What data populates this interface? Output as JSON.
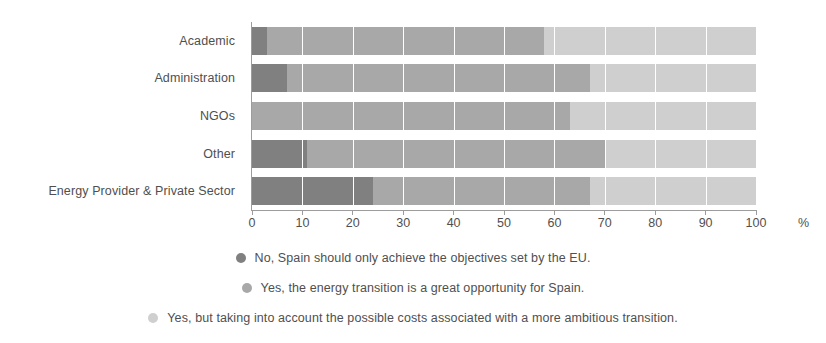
{
  "chart_data": {
    "type": "bar",
    "orientation": "horizontal",
    "stacked": true,
    "stack_mode": "percent",
    "title": "",
    "subtitle": "",
    "xlabel": "%",
    "ylabel": "",
    "xlim": [
      0,
      100
    ],
    "xticks": [
      0,
      10,
      20,
      30,
      40,
      50,
      60,
      70,
      80,
      90,
      100
    ],
    "xtick_labels": [
      "0",
      "10",
      "20",
      "30",
      "40",
      "50",
      "60",
      "70",
      "80",
      "90",
      "100"
    ],
    "grid": true,
    "grid_axis": "x",
    "legend_position": "bottom",
    "categories": [
      "Academic",
      "Administration",
      "NGOs",
      "Other",
      "Energy Provider & Private Sector"
    ],
    "series": [
      {
        "name": "No, Spain should only achieve the objectives set by the EU.",
        "color": "#808080",
        "values": [
          3,
          7,
          0,
          11,
          24
        ]
      },
      {
        "name": "Yes, the energy transition is a great opportunity for Spain.",
        "color": "#a8a8a8",
        "values": [
          55,
          60,
          63,
          59,
          43
        ]
      },
      {
        "name": "Yes, but taking into account the possible costs associated with a more ambitious transition.",
        "color": "#cfcfcf",
        "values": [
          42,
          33,
          37,
          30,
          33
        ]
      }
    ],
    "cumulative_boundaries": [
      [
        3,
        58
      ],
      [
        7,
        67
      ],
      [
        0,
        63
      ],
      [
        11,
        70
      ],
      [
        24,
        67
      ]
    ]
  },
  "axis": {
    "unit_label": "%"
  },
  "legend": {
    "items": [
      {
        "label": "No, Spain should only achieve the objectives set by the EU.",
        "color": "#808080"
      },
      {
        "label": "Yes, the energy transition is a great opportunity for Spain.",
        "color": "#a8a8a8"
      },
      {
        "label": "Yes, but taking into account the possible costs associated with a more ambitious transition.",
        "color": "#cfcfcf"
      }
    ]
  },
  "colors": {
    "series_1": "#808080",
    "series_2": "#a8a8a8",
    "series_3": "#cfcfcf",
    "axis": "#9c9c9c",
    "text": "#4f4f4f",
    "background": "#ffffff"
  }
}
